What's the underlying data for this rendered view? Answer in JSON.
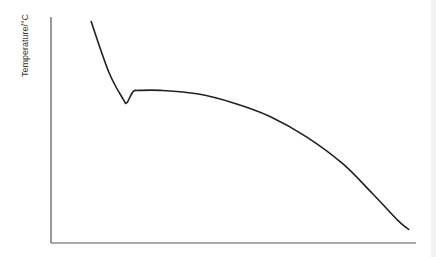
{
  "chart_data": {
    "type": "line",
    "title": "",
    "xlabel": "",
    "ylabel": "Temperature/°C",
    "grid": false,
    "legend": null,
    "x_ticks": [],
    "y_ticks": [],
    "series": [
      {
        "name": "cooling curve",
        "x": [
          0.11,
          0.16,
          0.2,
          0.205,
          0.21,
          0.225,
          0.24,
          0.3,
          0.4,
          0.5,
          0.6,
          0.7,
          0.8,
          0.88,
          0.95,
          0.98
        ],
        "y": [
          0.98,
          0.75,
          0.63,
          0.62,
          0.625,
          0.67,
          0.675,
          0.675,
          0.66,
          0.62,
          0.56,
          0.47,
          0.35,
          0.22,
          0.1,
          0.06
        ]
      }
    ],
    "xlim": [
      0,
      1
    ],
    "ylim": [
      0,
      1
    ],
    "colors": {
      "line": "#222222",
      "axis": "#555555",
      "background": "#ffffff"
    }
  }
}
